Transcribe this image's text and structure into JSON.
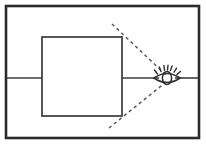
{
  "figure": {
    "background_color": "#ffffff",
    "ink_color": "#2b2b2b",
    "dash_color": "#5a5a5a",
    "canvas": {
      "width": 206,
      "height": 145
    }
  },
  "frame": {
    "name": "outer-border-rectangle",
    "x": 6,
    "y": 6,
    "width": 193,
    "height": 132,
    "stroke_width": 2.6,
    "color": "#2b2b2b"
  },
  "object": {
    "name": "square-object",
    "label": "",
    "x": 42,
    "y": 37,
    "width": 80,
    "height": 79,
    "stroke_width": 1.7,
    "color": "#3a3a3a"
  },
  "axis": {
    "name": "optical-axis",
    "label": "",
    "y": 78,
    "segments": [
      {
        "name": "axis-left-segment",
        "x1": 7,
        "x2": 42
      },
      {
        "name": "axis-middle-segment",
        "x1": 122,
        "x2": 158
      },
      {
        "name": "axis-right-segment",
        "x1": 176,
        "x2": 198
      }
    ],
    "color": "#3f3f3f",
    "stroke_width": 1.6
  },
  "sight_lines": [
    {
      "name": "upper-sight-line",
      "from": {
        "x": 112,
        "y": 24
      },
      "to": {
        "x": 167,
        "y": 76
      },
      "dash": "3.2 3.2"
    },
    {
      "name": "lower-sight-line",
      "from": {
        "x": 109,
        "y": 128
      },
      "to": {
        "x": 167,
        "y": 82
      },
      "dash": "3.2 3.2"
    }
  ],
  "eye": {
    "name": "eye-symbol",
    "label": "",
    "center": {
      "x": 167,
      "y": 78
    },
    "width": 26,
    "height": 14,
    "iris_width": 9,
    "iris_height": 13,
    "lash_count": 7,
    "color": "#2f2f2f"
  }
}
